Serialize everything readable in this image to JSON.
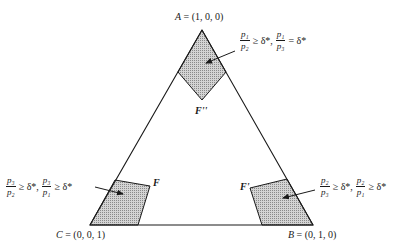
{
  "vertices": {
    "A": {
      "name": "A",
      "coord": "(1, 0, 0)"
    },
    "B": {
      "name": "B",
      "coord": "(0, 1, 0)"
    },
    "C": {
      "name": "C",
      "coord": "(0, 0, 1)"
    }
  },
  "regions": {
    "top": {
      "label": "F''"
    },
    "left": {
      "label": "F"
    },
    "right": {
      "label": "F'"
    }
  },
  "conditions": {
    "top": {
      "frac1": {
        "num": "p₁",
        "den": "p₂"
      },
      "rel1": "≥ δ*,",
      "frac2": {
        "num": "p₁",
        "den": "p₃"
      },
      "rel2": "= δ*"
    },
    "left": {
      "frac1": {
        "num": "p₃",
        "den": "p₂"
      },
      "rel1": "≥ δ*,",
      "frac2": {
        "num": "p₃",
        "den": "p₁"
      },
      "rel2": "≥ δ*"
    },
    "right": {
      "frac1": {
        "num": "p₂",
        "den": "p₃"
      },
      "rel1": "≥ δ*,",
      "frac2": {
        "num": "p₂",
        "den": "p₁"
      },
      "rel2": "≥ δ*"
    }
  },
  "colors": {
    "line": "#1a1a1a",
    "shade": "#b8b8b8"
  }
}
